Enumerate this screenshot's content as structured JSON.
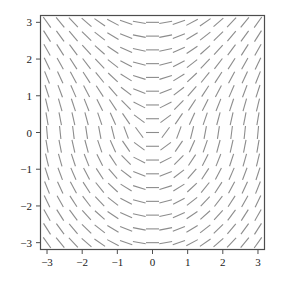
{
  "figure": {
    "kind": "direction-field-plot",
    "background_color": "#ffffff",
    "width": 281,
    "height": 287
  },
  "chart_data": {
    "type": "scatter",
    "plot_kind": "direction-field",
    "title": "",
    "subtitle": "",
    "xlabel": "",
    "ylabel": "",
    "xlim": [
      -3.2,
      3.2
    ],
    "ylim": [
      -3.2,
      3.2
    ],
    "grid": false,
    "legend": null,
    "xticks": [
      -3,
      -2,
      -1,
      0,
      1,
      2,
      3
    ],
    "xticklabels": [
      "−3",
      "−2",
      "−1",
      "0",
      "1",
      "2",
      "3"
    ],
    "yticks": [
      -3,
      -2,
      -1,
      0,
      1,
      2,
      3
    ],
    "yticklabels": [
      "−3",
      "−2",
      "−1",
      "0",
      "1",
      "2",
      "3"
    ],
    "tick_direction": "out",
    "frame": true,
    "frame_color": "#4d4d4d",
    "segment_color": "#8c8c8c",
    "segment_width": 1.1,
    "segment_length_px": 13,
    "grid_nx": 17,
    "grid_ny": 17,
    "sample_x_min": -3.0,
    "sample_x_max": 3.0,
    "sample_y_min": -3.0,
    "sample_y_max": 3.0,
    "slope_model": "x_over_soft_abs_y",
    "slope_scale": 1.0,
    "slope_softening": 0.28,
    "slope_y_gain": 0.62
  },
  "axes": {
    "x_axis_name": "horizontal-axis",
    "y_axis_name": "vertical-axis",
    "plot_left_px": 40,
    "plot_top_px": 15,
    "plot_right_px": 265,
    "plot_bottom_px": 250
  }
}
